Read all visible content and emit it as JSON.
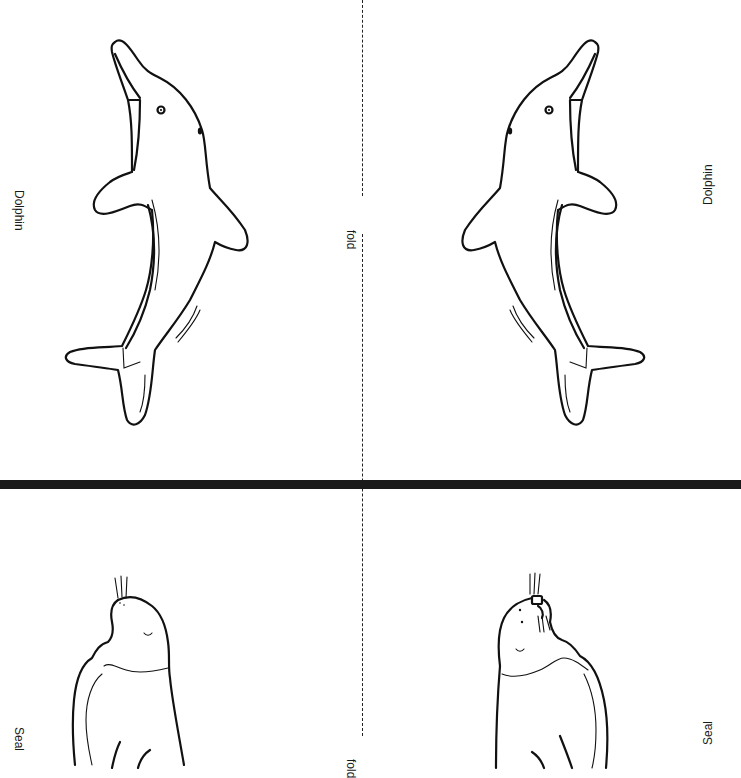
{
  "sheet": {
    "type": "foldable picture cards",
    "colors": {
      "background": "#ffffff",
      "ink": "#111111",
      "divider": "#1a1a1a"
    }
  },
  "cards": [
    {
      "animal": "dolphin",
      "left_label": "Dolphin",
      "right_label": "Dolphin",
      "fold_label": "fold"
    },
    {
      "animal": "seal",
      "left_label": "Seal",
      "right_label": "Seal",
      "fold_label": "fold"
    }
  ]
}
